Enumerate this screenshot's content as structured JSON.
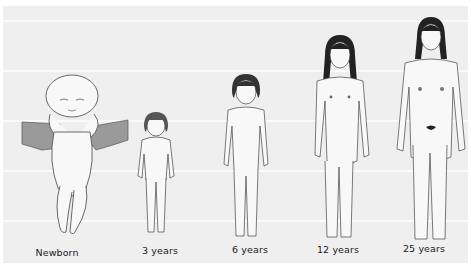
{
  "figure": {
    "background_color": "#efefef",
    "grid_line_color": "#fbfbfb",
    "stages": [
      {
        "id": "newborn",
        "label": "Newborn"
      },
      {
        "id": "3y",
        "label": "3 years"
      },
      {
        "id": "6y",
        "label": "6 years"
      },
      {
        "id": "12y",
        "label": "12 years"
      },
      {
        "id": "25y",
        "label": "25 years"
      }
    ]
  }
}
